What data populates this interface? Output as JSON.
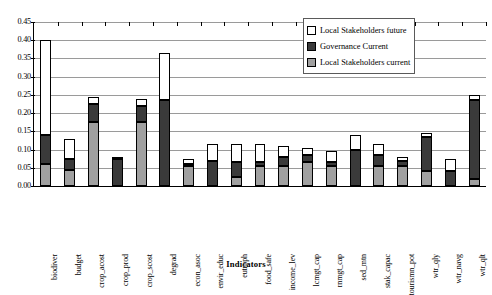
{
  "chart_data": {
    "type": "bar",
    "subtype": "stacked-vertical",
    "title": "",
    "xlabel": "Indicators",
    "ylabel": "",
    "ylim": [
      0.0,
      0.45
    ],
    "ytick_labels": [
      "0.45",
      "0.40",
      "0.35",
      "0.30",
      "0.25",
      "0.20",
      "0.15",
      "0.10",
      "0.05",
      "0.00"
    ],
    "ytick_values": [
      0.45,
      0.4,
      0.35,
      0.3,
      0.25,
      0.2,
      0.15,
      0.1,
      0.05,
      0.0
    ],
    "grid": "horizontal",
    "legend_position": "top-right",
    "legend": [
      "Local Stakeholders future",
      "Governance Current",
      "Local Stakeholders current"
    ],
    "categories": [
      "biodiver",
      "budget",
      "crop_acost",
      "crop_prod",
      "crop_scost",
      "degrad",
      "econ_asoc",
      "envir_educ",
      "eutroph",
      "food_safe",
      "income_lev",
      "lcmgt_cap",
      "rnmgt_cap",
      "sed_mtn",
      "stak_capac",
      "tourismn_pot",
      "wtr_qly",
      "wtr_navg",
      "wtr_qlt"
    ],
    "series": [
      {
        "name": "Local Stakeholders current",
        "color": "#a0a0a0",
        "values": [
          0.06,
          0.045,
          0.175,
          0.0,
          0.175,
          0.0,
          0.055,
          0.0,
          0.025,
          0.055,
          0.055,
          0.065,
          0.055,
          0.0,
          0.055,
          0.055,
          0.04,
          0.0,
          0.02
        ]
      },
      {
        "name": "Governance Current",
        "color": "#3a3a3a",
        "values": [
          0.08,
          0.03,
          0.05,
          0.075,
          0.045,
          0.235,
          0.005,
          0.07,
          0.04,
          0.01,
          0.025,
          0.02,
          0.01,
          0.1,
          0.03,
          0.015,
          0.095,
          0.04,
          0.215
        ]
      },
      {
        "name": "Local Stakeholders future",
        "color": "#ffffff",
        "values": [
          0.26,
          0.055,
          0.02,
          0.005,
          0.02,
          0.13,
          0.015,
          0.045,
          0.05,
          0.05,
          0.03,
          0.02,
          0.03,
          0.04,
          0.03,
          0.01,
          0.01,
          0.035,
          0.015
        ]
      }
    ],
    "totals": [
      0.4,
      0.13,
      0.245,
      0.08,
      0.24,
      0.365,
      0.075,
      0.115,
      0.115,
      0.115,
      0.11,
      0.105,
      0.095,
      0.14,
      0.115,
      0.08,
      0.145,
      0.075,
      0.25
    ]
  }
}
